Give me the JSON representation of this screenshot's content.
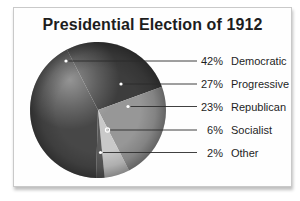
{
  "chart_data": {
    "type": "pie",
    "title": "Presidential Election of 1912",
    "legend_position": "right",
    "total_percent": 100,
    "segments": [
      {
        "label": "Democratic",
        "percent": 42,
        "percent_label": "42%",
        "color": "#474747"
      },
      {
        "label": "Progressive",
        "percent": 27,
        "percent_label": "27%",
        "color": "#3d3d3d"
      },
      {
        "label": "Republican",
        "percent": 23,
        "percent_label": "23%",
        "color": "#979797"
      },
      {
        "label": "Socialist",
        "percent": 6,
        "percent_label": "6%",
        "color": "#c9c9c9"
      },
      {
        "label": "Other",
        "percent": 2,
        "percent_label": "2%",
        "color": "#5a5a5a"
      }
    ]
  }
}
